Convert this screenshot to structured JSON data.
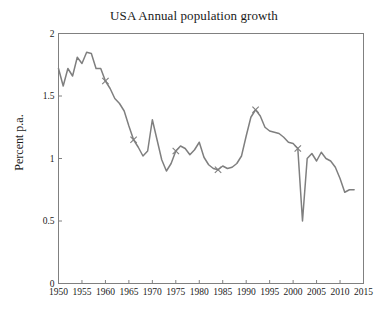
{
  "chart_data": {
    "type": "line",
    "title": "USA Annual population growth",
    "xlabel": "",
    "ylabel": "Percent p.a.",
    "xlim": [
      1950,
      2015
    ],
    "ylim": [
      0,
      2
    ],
    "grid": false,
    "legend": "none",
    "line_color": "#7f7f7f",
    "marker": "x",
    "axis_color": "#808080",
    "background": "#ffffff",
    "xticks": [
      1950,
      1955,
      1960,
      1965,
      1970,
      1975,
      1980,
      1985,
      1990,
      1995,
      2000,
      2005,
      2010,
      2015
    ],
    "xtick_labels": [
      "1950",
      "1955",
      "1960",
      "1965",
      "1970",
      "1975",
      "1980",
      "1985",
      "1990",
      "1995",
      "2000",
      "2005",
      "2010",
      "2015"
    ],
    "yticks": [
      0,
      0.5,
      1,
      1.5,
      2
    ],
    "ytick_labels": [
      "0",
      "0.5",
      "1",
      "1.5",
      "2"
    ],
    "series": [
      {
        "name": "USA annual population growth",
        "x": [
          1950,
          1951,
          1952,
          1953,
          1954,
          1955,
          1956,
          1957,
          1958,
          1959,
          1960,
          1961,
          1962,
          1963,
          1964,
          1965,
          1966,
          1967,
          1968,
          1969,
          1970,
          1971,
          1972,
          1973,
          1974,
          1975,
          1976,
          1977,
          1978,
          1979,
          1980,
          1981,
          1982,
          1983,
          1984,
          1985,
          1986,
          1987,
          1988,
          1989,
          1990,
          1991,
          1992,
          1993,
          1994,
          1995,
          1996,
          1997,
          1998,
          1999,
          2000,
          2001,
          2002,
          2003,
          2004,
          2005,
          2006,
          2007,
          2008,
          2009,
          2010,
          2011,
          2012,
          2013
        ],
        "y": [
          1.72,
          1.58,
          1.72,
          1.66,
          1.81,
          1.76,
          1.85,
          1.84,
          1.72,
          1.72,
          1.62,
          1.56,
          1.48,
          1.44,
          1.38,
          1.26,
          1.15,
          1.09,
          1.02,
          1.06,
          1.31,
          1.15,
          0.99,
          0.9,
          0.96,
          1.06,
          1.1,
          1.08,
          1.03,
          1.07,
          1.13,
          1.01,
          0.95,
          0.92,
          0.91,
          0.94,
          0.92,
          0.93,
          0.96,
          1.02,
          1.18,
          1.33,
          1.39,
          1.34,
          1.25,
          1.22,
          1.21,
          1.2,
          1.17,
          1.13,
          1.12,
          1.08,
          0.5,
          1.0,
          1.04,
          0.98,
          1.05,
          1.0,
          0.98,
          0.93,
          0.84,
          0.73,
          0.75,
          0.75
        ],
        "marker_points": [
          {
            "x": 1960,
            "y": 1.62
          },
          {
            "x": 1966,
            "y": 1.15
          },
          {
            "x": 1975,
            "y": 1.06
          },
          {
            "x": 1984,
            "y": 0.91
          },
          {
            "x": 1992,
            "y": 1.39
          },
          {
            "x": 2001,
            "y": 1.08
          }
        ]
      }
    ]
  }
}
